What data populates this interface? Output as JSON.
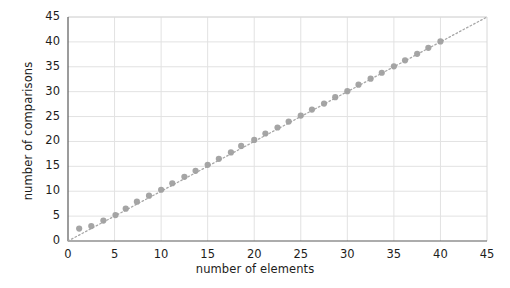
{
  "chart_data": {
    "type": "scatter",
    "title": "",
    "xlabel": "number of elements",
    "ylabel": "number of comparisons",
    "xlim": [
      0,
      45
    ],
    "ylim": [
      0,
      45
    ],
    "xticks": [
      0,
      5,
      10,
      15,
      20,
      25,
      30,
      35,
      40,
      45
    ],
    "yticks": [
      0,
      5,
      10,
      15,
      20,
      25,
      30,
      35,
      40,
      45
    ],
    "grid": true,
    "legend": "none",
    "marker_color": "#a0a0a0",
    "trendline_color": "#a8a8a8",
    "trendline_style": "dotted",
    "trendline": {
      "slope": 1.0,
      "intercept": 0.0,
      "x_start": 0,
      "x_end": 45
    },
    "series": [
      {
        "name": "comparisons",
        "x": [
          1.2,
          2.5,
          3.8,
          5.1,
          6.2,
          7.4,
          8.7,
          10.0,
          11.2,
          12.5,
          13.7,
          15.0,
          16.2,
          17.5,
          18.6,
          20.0,
          21.2,
          22.5,
          23.7,
          25.0,
          26.2,
          27.5,
          28.7,
          30.0,
          31.2,
          32.5,
          33.7,
          35.0,
          36.2,
          37.5,
          38.7,
          40.0
        ],
        "y": [
          2.5,
          3.0,
          4.1,
          5.2,
          6.5,
          7.9,
          9.1,
          10.3,
          11.6,
          12.9,
          14.1,
          15.3,
          16.5,
          17.8,
          19.1,
          20.3,
          21.6,
          22.8,
          24.0,
          25.2,
          26.4,
          27.6,
          28.9,
          30.1,
          31.4,
          32.6,
          33.8,
          35.1,
          36.3,
          37.6,
          38.8,
          40.1
        ]
      }
    ]
  },
  "axes": {
    "y_title": "number of comparisons",
    "x_title": "number of elements",
    "x_tick_labels": [
      "0",
      "5",
      "10",
      "15",
      "20",
      "25",
      "30",
      "35",
      "40",
      "45"
    ],
    "y_tick_labels": [
      "0",
      "5",
      "10",
      "15",
      "20",
      "25",
      "30",
      "35",
      "40",
      "45"
    ]
  }
}
